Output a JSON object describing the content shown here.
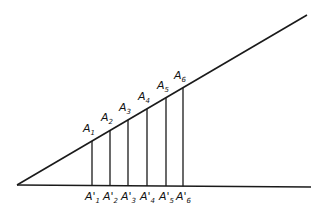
{
  "diagram": {
    "vertex": [
      17,
      185
    ],
    "upper_line_end": [
      307,
      15
    ],
    "base_line_end": [
      311,
      187
    ],
    "line_color": "#1a1a1a",
    "points_upper": [
      {
        "label": "A",
        "sub": "1",
        "x": 92
      },
      {
        "label": "A",
        "sub": "2",
        "x": 110
      },
      {
        "label": "A",
        "sub": "3",
        "x": 128
      },
      {
        "label": "A",
        "sub": "4",
        "x": 147
      },
      {
        "label": "A",
        "sub": "5",
        "x": 166
      },
      {
        "label": "A",
        "sub": "6",
        "x": 183
      }
    ],
    "points_lower": [
      {
        "label": "A'",
        "sub": "1",
        "x": 92
      },
      {
        "label": "A'",
        "sub": "2",
        "x": 110
      },
      {
        "label": "A'",
        "sub": "3",
        "x": 128
      },
      {
        "label": "A'",
        "sub": "4",
        "x": 147
      },
      {
        "label": "A'",
        "sub": "5",
        "x": 166
      },
      {
        "label": "A'",
        "sub": "6",
        "x": 183
      }
    ]
  }
}
